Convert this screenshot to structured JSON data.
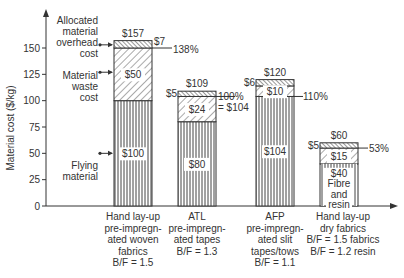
{
  "chart_data": {
    "type": "bar",
    "stacked": true,
    "title": "",
    "xlabel": "",
    "ylabel": "Material cost ($/kg)",
    "ylim": [
      0,
      160
    ],
    "yticks": [
      0,
      25,
      50,
      75,
      100,
      125,
      150
    ],
    "grid": false,
    "categories": [
      [
        "Hand lay-up",
        "pre-impregn-",
        "ated woven",
        "fabrics",
        "B/F = 1.5"
      ],
      [
        "ATL",
        "pre-impregn-",
        "ated tapes",
        "B/F = 1.3"
      ],
      [
        "AFP",
        "pre-impregn-",
        "ated slit",
        "tapes/tows",
        "B/F = 1.1"
      ],
      [
        "Hand lay-up",
        "dry fabrics",
        "B/F = 1.5 fabrics",
        "B/F = 1.2 resin"
      ]
    ],
    "series": [
      {
        "name": "Flying material",
        "values": [
          100,
          80,
          104,
          40
        ],
        "pattern": "vertical-lines"
      },
      {
        "name": "Material waste cost",
        "values": [
          50,
          24,
          10,
          15
        ],
        "pattern": "diagonal-hatch"
      },
      {
        "name": "Allocated material overhead cost",
        "values": [
          7,
          5,
          6,
          5
        ],
        "pattern": "dense-back-hatch"
      }
    ],
    "totals": [
      157,
      109,
      120,
      60
    ],
    "segment_labels": [
      {
        "flying": "$100",
        "waste": "$50",
        "overhead": "$7",
        "total": "$157"
      },
      {
        "flying": "$80",
        "waste": "$24",
        "overhead": "$5",
        "total": "$109"
      },
      {
        "flying": "$104",
        "waste": "$10",
        "overhead": "$6",
        "total": "$120"
      },
      {
        "flying": [
          "$40",
          "Fibre",
          "and",
          "resin"
        ],
        "waste": "$15",
        "overhead": "$5",
        "total": "$60"
      }
    ],
    "annotations": [
      {
        "text": "138%",
        "bar": 0
      },
      {
        "text": "100%",
        "bar": 1
      },
      {
        "text": "= $104",
        "bar": 1
      },
      {
        "text": "110%",
        "bar": 2
      },
      {
        "text": "53%",
        "bar": 3
      }
    ],
    "legend_callouts": [
      [
        "Allocated",
        "material",
        "overhead",
        "cost"
      ],
      [
        "Material",
        "waste",
        "cost"
      ],
      [
        "Flying",
        "material"
      ]
    ]
  }
}
